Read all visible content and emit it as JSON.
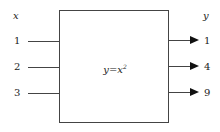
{
  "diagram": {
    "input_header": "x",
    "output_header": "y",
    "function_label": "y=x",
    "function_exponent": "2",
    "inputs": [
      "1",
      "2",
      "3"
    ],
    "outputs": [
      "1",
      "4",
      "9"
    ]
  }
}
